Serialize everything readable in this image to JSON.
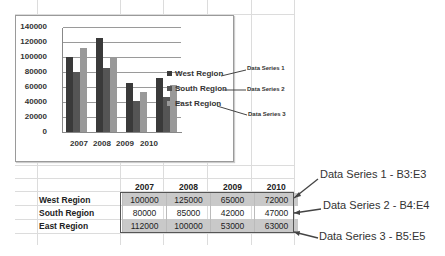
{
  "chart_data": {
    "type": "bar",
    "title": "",
    "xlabel": "",
    "ylabel": "",
    "categories": [
      "2007",
      "2008",
      "2009",
      "2010"
    ],
    "series": [
      {
        "name": "West Region",
        "color": "#3a3a3a",
        "values": [
          100000,
          125000,
          65000,
          72000
        ]
      },
      {
        "name": "South Region",
        "color": "#555555",
        "values": [
          80000,
          85000,
          42000,
          47000
        ]
      },
      {
        "name": "East Region",
        "color": "#999999",
        "values": [
          112000,
          100000,
          53000,
          63000
        ]
      }
    ],
    "ylim": [
      0,
      140000
    ],
    "yticks": [
      "140000",
      "120000",
      "100000",
      "80000",
      "60000",
      "40000",
      "20000",
      "0"
    ],
    "grid": true,
    "legend_position": "right"
  },
  "chart": {
    "legend": [
      "West Region",
      "South Region",
      "East Region"
    ],
    "callouts": [
      "Data Series 1",
      "Data Series 2",
      "Data Series 3"
    ]
  },
  "table": {
    "headers": [
      "2007",
      "2008",
      "2009",
      "2010"
    ],
    "rows": [
      {
        "label": "West Region",
        "values": [
          "100000",
          "125000",
          "65000",
          "72000"
        ]
      },
      {
        "label": "South Region",
        "values": [
          "80000",
          "85000",
          "42000",
          "47000"
        ]
      },
      {
        "label": "East Region",
        "values": [
          "112000",
          "100000",
          "53000",
          "63000"
        ]
      }
    ]
  },
  "annotations": [
    "Data Series 1 - B3:E3",
    "Data Series 2 - B4:E4",
    "Data Series 3 - B5:E5"
  ]
}
